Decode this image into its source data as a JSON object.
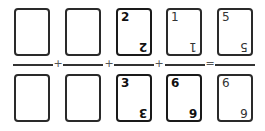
{
  "equation": {
    "description": "Fraction sum built from cards",
    "fractions": [
      {
        "numerator": {
          "value": "",
          "bold": false
        },
        "denominator": {
          "value": "",
          "bold": false
        }
      },
      {
        "numerator": {
          "value": "",
          "bold": false
        },
        "denominator": {
          "value": "",
          "bold": false
        }
      },
      {
        "numerator": {
          "value": "2",
          "bold": true
        },
        "denominator": {
          "value": "3",
          "bold": true
        }
      },
      {
        "numerator": {
          "value": "1",
          "bold": false
        },
        "denominator": {
          "value": "6",
          "bold": true
        }
      },
      {
        "numerator": {
          "value": "5",
          "bold": false
        },
        "denominator": {
          "value": "6",
          "bold": false
        }
      }
    ],
    "operators": [
      "+",
      "+",
      "+",
      "="
    ]
  }
}
